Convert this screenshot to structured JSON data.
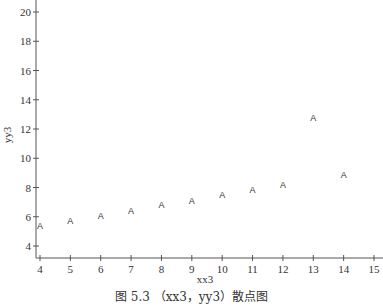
{
  "chart_data": {
    "type": "scatter",
    "title": "",
    "xlabel": "xx3",
    "ylabel": "yy3",
    "marker": "A",
    "x": [
      4,
      5,
      6,
      7,
      8,
      9,
      10,
      11,
      12,
      13,
      14
    ],
    "y": [
      5.39,
      5.73,
      6.08,
      6.42,
      6.77,
      7.11,
      7.46,
      7.81,
      8.15,
      12.74,
      8.84
    ],
    "xlim": [
      4,
      15
    ],
    "ylim": [
      3.2,
      20.8
    ],
    "xticks": [
      4,
      5,
      6,
      7,
      8,
      9,
      10,
      11,
      12,
      13,
      14,
      15
    ],
    "yticks": [
      4,
      6,
      8,
      10,
      12,
      14,
      16,
      18,
      20
    ],
    "grid": false,
    "legend": null
  },
  "caption": "图 5.3 （xx3，yy3）散点图"
}
